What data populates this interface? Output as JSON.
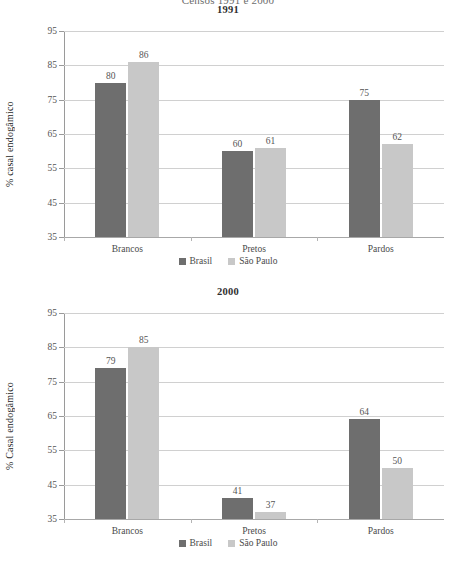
{
  "suptitle": "Censos 1991 e 2000",
  "legend": {
    "items": [
      {
        "label": "Brasil",
        "color": "#6e6e6e"
      },
      {
        "label": "São Paulo",
        "color": "#c8c8c8"
      }
    ]
  },
  "chart_data": [
    {
      "type": "bar",
      "title": "1991",
      "xlabel": "",
      "ylabel": "% casal endogâmico",
      "categories": [
        "Brancos",
        "Pretos",
        "Pardos"
      ],
      "series": [
        {
          "name": "Brasil",
          "color": "#6e6e6e",
          "values": [
            80,
            60,
            75
          ]
        },
        {
          "name": "São Paulo",
          "color": "#c8c8c8",
          "values": [
            86,
            61,
            62
          ]
        }
      ],
      "ylim": [
        35,
        95
      ],
      "yticks": [
        95,
        85,
        75,
        65,
        55,
        45,
        35
      ],
      "grid": true,
      "legend_position": "bottom"
    },
    {
      "type": "bar",
      "title": "2000",
      "xlabel": "",
      "ylabel": "% Casal endogâmico",
      "categories": [
        "Brancos",
        "Pretos",
        "Pardos"
      ],
      "series": [
        {
          "name": "Brasil",
          "color": "#6e6e6e",
          "values": [
            79,
            41,
            64
          ]
        },
        {
          "name": "São Paulo",
          "color": "#c8c8c8",
          "values": [
            85,
            37,
            50
          ]
        }
      ],
      "ylim": [
        35,
        95
      ],
      "yticks": [
        95,
        85,
        75,
        65,
        55,
        45,
        35
      ],
      "grid": true,
      "legend_position": "bottom"
    }
  ]
}
